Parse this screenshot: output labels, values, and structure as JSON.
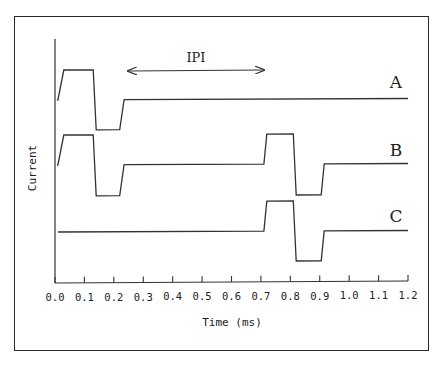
{
  "chart_data": {
    "type": "line",
    "title": "",
    "xlabel": "Time (ms)",
    "ylabel": "Current",
    "xlim": [
      0.0,
      1.2
    ],
    "x_ticks": [
      "0.0",
      "0.1",
      "0.2",
      "0.3",
      "0.4",
      "0.5",
      "0.6",
      "0.7",
      "0.8",
      "0.9",
      "1.0",
      "1.1",
      "1.2"
    ],
    "grid": false,
    "legend": "inline labels at right end of each trace",
    "annotation": {
      "text": "IPI",
      "type": "double-arrow",
      "x_start": 0.24,
      "x_end": 0.72
    },
    "series": [
      {
        "name": "A",
        "description": "single biphasic pulse",
        "x": [
          0.0,
          0.01,
          0.03,
          0.13,
          0.14,
          0.22,
          0.235,
          1.2
        ],
        "y": [
          0,
          0,
          1,
          1,
          -1,
          -1,
          0,
          0
        ]
      },
      {
        "name": "B",
        "description": "two biphasic pulses separated by IPI",
        "x": [
          0.0,
          0.01,
          0.03,
          0.13,
          0.14,
          0.22,
          0.235,
          0.71,
          0.72,
          0.81,
          0.82,
          0.905,
          0.915,
          1.2
        ],
        "y": [
          0,
          0,
          1,
          1,
          -1,
          -1,
          0,
          0,
          1,
          1,
          -1,
          -1,
          0,
          0
        ]
      },
      {
        "name": "C",
        "description": "single biphasic pulse delayed",
        "x": [
          0.0,
          0.71,
          0.72,
          0.81,
          0.82,
          0.905,
          0.915,
          1.2
        ],
        "y": [
          0,
          0,
          1,
          1,
          -1,
          -1,
          0,
          0
        ]
      }
    ]
  },
  "labels": {
    "ipi": "IPI",
    "trace_a": "A",
    "trace_b": "B",
    "trace_c": "C",
    "x_axis_title": "Time (ms)",
    "y_axis_title": "Current",
    "ticks": [
      "0.0",
      "0.1",
      "0.2",
      "0.3",
      "0.4",
      "0.5",
      "0.6",
      "0.7",
      "0.8",
      "0.9",
      "1.0",
      "1.1",
      "1.2"
    ]
  },
  "colors": {
    "line": "#333333",
    "frame": "#2a2a2a",
    "background": "#ffffff"
  }
}
